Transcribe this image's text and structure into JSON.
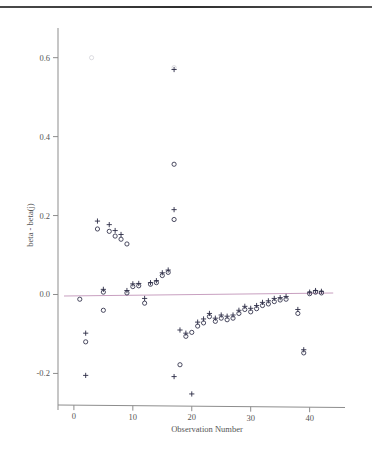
{
  "chart_data": {
    "type": "scatter",
    "title": "",
    "xlabel": "Observation Number",
    "ylabel": "beta - beta(j)",
    "xlim": [
      -1,
      46
    ],
    "ylim": [
      -0.28,
      0.66
    ],
    "xticks": [
      0,
      10,
      20,
      30,
      40
    ],
    "xtick_labels": [
      "0",
      "10",
      "20",
      "30",
      "40"
    ],
    "yticks": [
      -0.2,
      0.0,
      0.2,
      0.4,
      0.6
    ],
    "ytick_labels": [
      "-0.2",
      "0.0",
      "0.2",
      "0.4",
      "0.6"
    ],
    "grid": false,
    "legend": "none",
    "reference_line": {
      "y": 0.0,
      "color": "#c8a0c0",
      "note": "horizontal zero line"
    },
    "marker_colors": {
      "plus": "#2b2b45",
      "circle": "#2b2b45"
    },
    "series": [
      {
        "name": "plus",
        "marker": "+",
        "points": [
          {
            "x": 2,
            "y": -0.098
          },
          {
            "x": 2,
            "y": -0.205
          },
          {
            "x": 4,
            "y": 0.186
          },
          {
            "x": 5,
            "y": 0.013
          },
          {
            "x": 6,
            "y": 0.177
          },
          {
            "x": 7,
            "y": 0.162
          },
          {
            "x": 8,
            "y": 0.152
          },
          {
            "x": 9,
            "y": 0.01
          },
          {
            "x": 10,
            "y": 0.027
          },
          {
            "x": 11,
            "y": 0.028
          },
          {
            "x": 12,
            "y": -0.01
          },
          {
            "x": 13,
            "y": 0.03
          },
          {
            "x": 14,
            "y": 0.035
          },
          {
            "x": 15,
            "y": 0.055
          },
          {
            "x": 16,
            "y": 0.062
          },
          {
            "x": 17,
            "y": 0.215
          },
          {
            "x": 17,
            "y": 0.57
          },
          {
            "x": 17,
            "y": -0.208
          },
          {
            "x": 18,
            "y": -0.09
          },
          {
            "x": 19,
            "y": -0.098
          },
          {
            "x": 20,
            "y": -0.252
          },
          {
            "x": 21,
            "y": -0.07
          },
          {
            "x": 22,
            "y": -0.062
          },
          {
            "x": 23,
            "y": -0.048
          },
          {
            "x": 24,
            "y": -0.06
          },
          {
            "x": 25,
            "y": -0.052
          },
          {
            "x": 26,
            "y": -0.055
          },
          {
            "x": 27,
            "y": -0.052
          },
          {
            "x": 28,
            "y": -0.04
          },
          {
            "x": 29,
            "y": -0.03
          },
          {
            "x": 30,
            "y": -0.035
          },
          {
            "x": 31,
            "y": -0.028
          },
          {
            "x": 32,
            "y": -0.02
          },
          {
            "x": 33,
            "y": -0.016
          },
          {
            "x": 34,
            "y": -0.01
          },
          {
            "x": 35,
            "y": -0.008
          },
          {
            "x": 36,
            "y": -0.005
          },
          {
            "x": 38,
            "y": -0.038
          },
          {
            "x": 39,
            "y": -0.14
          },
          {
            "x": 40,
            "y": 0.006
          },
          {
            "x": 41,
            "y": 0.01
          },
          {
            "x": 42,
            "y": 0.008
          }
        ]
      },
      {
        "name": "circle",
        "marker": "o",
        "points": [
          {
            "x": 1,
            "y": -0.012
          },
          {
            "x": 2,
            "y": -0.12
          },
          {
            "x": 4,
            "y": 0.166
          },
          {
            "x": 5,
            "y": 0.006
          },
          {
            "x": 5,
            "y": -0.04
          },
          {
            "x": 6,
            "y": 0.16
          },
          {
            "x": 7,
            "y": 0.148
          },
          {
            "x": 8,
            "y": 0.14
          },
          {
            "x": 9,
            "y": 0.128
          },
          {
            "x": 9,
            "y": 0.004
          },
          {
            "x": 10,
            "y": 0.02
          },
          {
            "x": 11,
            "y": 0.022
          },
          {
            "x": 12,
            "y": -0.022
          },
          {
            "x": 13,
            "y": 0.026
          },
          {
            "x": 14,
            "y": 0.03
          },
          {
            "x": 15,
            "y": 0.048
          },
          {
            "x": 16,
            "y": 0.056
          },
          {
            "x": 17,
            "y": 0.19
          },
          {
            "x": 17,
            "y": 0.33
          },
          {
            "x": 18,
            "y": -0.178
          },
          {
            "x": 19,
            "y": -0.106
          },
          {
            "x": 20,
            "y": -0.096
          },
          {
            "x": 21,
            "y": -0.08
          },
          {
            "x": 22,
            "y": -0.072
          },
          {
            "x": 23,
            "y": -0.056
          },
          {
            "x": 24,
            "y": -0.068
          },
          {
            "x": 25,
            "y": -0.06
          },
          {
            "x": 26,
            "y": -0.064
          },
          {
            "x": 27,
            "y": -0.06
          },
          {
            "x": 28,
            "y": -0.048
          },
          {
            "x": 29,
            "y": -0.038
          },
          {
            "x": 30,
            "y": -0.044
          },
          {
            "x": 31,
            "y": -0.036
          },
          {
            "x": 32,
            "y": -0.028
          },
          {
            "x": 33,
            "y": -0.024
          },
          {
            "x": 34,
            "y": -0.018
          },
          {
            "x": 35,
            "y": -0.014
          },
          {
            "x": 36,
            "y": -0.012
          },
          {
            "x": 38,
            "y": -0.048
          },
          {
            "x": 39,
            "y": -0.148
          },
          {
            "x": 40,
            "y": 0.002
          },
          {
            "x": 41,
            "y": 0.006
          },
          {
            "x": 42,
            "y": 0.004
          }
        ]
      },
      {
        "name": "faint-outliers",
        "marker": "o",
        "points": [
          {
            "x": 3,
            "y": 0.6
          },
          {
            "x": 17,
            "y": 0.575
          }
        ]
      }
    ]
  }
}
